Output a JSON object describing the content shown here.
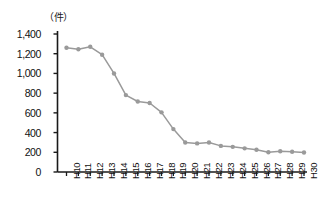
{
  "chart_data": {
    "type": "line",
    "title": "",
    "subtitle": "",
    "unit_label": "（件）",
    "xlabel": "",
    "ylabel": "",
    "ylim": [
      0,
      1400
    ],
    "ytick_labels": [
      "0",
      "200",
      "400",
      "600",
      "800",
      "1,000",
      "1,200",
      "1,400"
    ],
    "ytick_values": [
      0,
      200,
      400,
      600,
      800,
      1000,
      1200,
      1400
    ],
    "grid": false,
    "legend": "none",
    "marker": "circle",
    "line_color": "#9a9a9a",
    "marker_color": "#9a9a9a",
    "axis_color": "#1a1a1a",
    "categories": [
      "H10",
      "H11",
      "H12",
      "H13",
      "H14",
      "H15",
      "H16",
      "H17",
      "H18",
      "H19",
      "H20",
      "H21",
      "H22",
      "H23",
      "H24",
      "H25",
      "H26",
      "H27",
      "H28",
      "H29",
      "H30"
    ],
    "values": [
      1260,
      1245,
      1270,
      1190,
      1000,
      780,
      715,
      700,
      605,
      435,
      300,
      290,
      300,
      265,
      255,
      240,
      225,
      200,
      210,
      205,
      198
    ]
  }
}
